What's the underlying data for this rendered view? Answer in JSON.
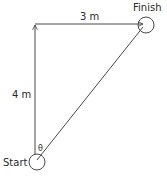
{
  "diagram": {
    "type": "displacement-vector-diagram",
    "labels": {
      "finish": "Finish",
      "start": "Start",
      "horizontal_distance": "3 m",
      "vertical_distance": "4 m",
      "angle": "θ"
    },
    "points": {
      "start": {
        "x": 36,
        "y": 162,
        "label": "Start"
      },
      "corner": {
        "x": 35,
        "y": 24
      },
      "finish": {
        "x": 145,
        "y": 25,
        "label": "Finish"
      }
    },
    "vectors": [
      {
        "name": "vertical",
        "from": "start",
        "to": "corner",
        "length_label": "4 m"
      },
      {
        "name": "horizontal",
        "from": "corner",
        "to": "finish",
        "length_label": "3 m"
      },
      {
        "name": "resultant",
        "from": "start",
        "to": "finish",
        "length_label": ""
      }
    ],
    "colors": {
      "line": "#4a4a4a",
      "text": "#2a2a2a",
      "background": "#ffffff"
    }
  }
}
